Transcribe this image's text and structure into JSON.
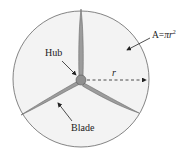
{
  "diagram": {
    "labels": {
      "hub": "Hub",
      "blade": "Blade",
      "radius": "r",
      "area_prefix": "A=",
      "area_pi": "π",
      "area_r": "r",
      "area_exp": "2"
    },
    "colors": {
      "circle_fill": "#f2f2f2",
      "circle_stroke": "#555555",
      "blade_fill": "#9a9a9a",
      "blade_stroke": "#6a6a6a",
      "hub_fill": "#8f8f8f",
      "text": "#222222"
    }
  }
}
